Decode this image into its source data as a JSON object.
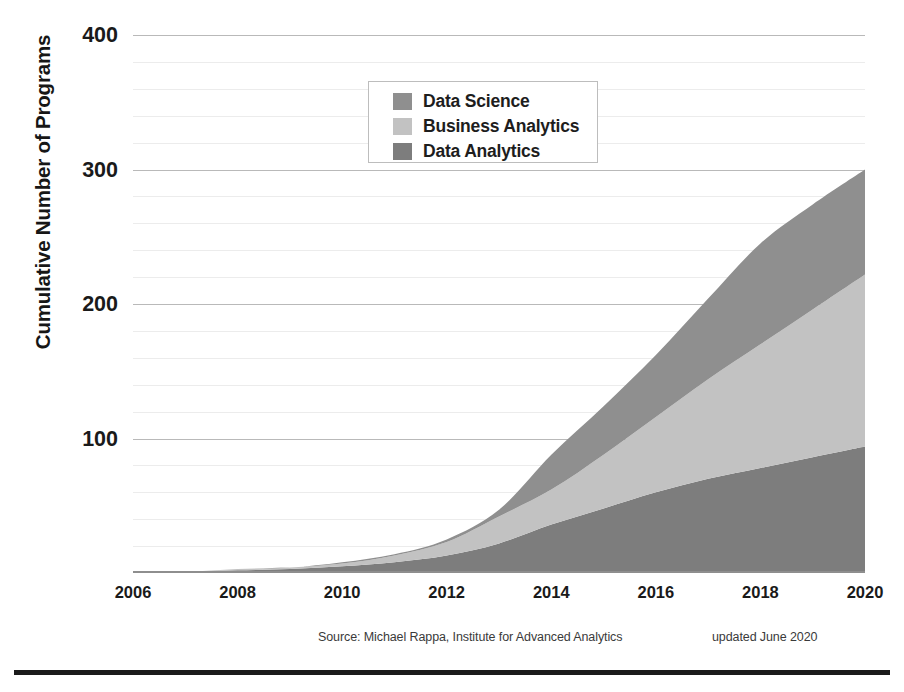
{
  "chart_data": {
    "type": "area",
    "stacked": true,
    "title": "",
    "xlabel": "",
    "ylabel": "Cumulative Number of Programs",
    "xlim": [
      2006,
      2020
    ],
    "ylim": [
      0,
      400
    ],
    "yticks": [
      100,
      200,
      300,
      400
    ],
    "ytick_labels": [
      "100",
      "200",
      "300",
      "400"
    ],
    "xticks": [
      2006,
      2008,
      2010,
      2012,
      2014,
      2016,
      2018,
      2020
    ],
    "xtick_labels": [
      "2006",
      "2008",
      "2010",
      "2012",
      "2014",
      "2016",
      "2018",
      "2020"
    ],
    "grid": true,
    "legend_position": "upper-center",
    "x": [
      2006,
      2007,
      2008,
      2009,
      2010,
      2011,
      2012,
      2013,
      2014,
      2015,
      2016,
      2017,
      2018,
      2019,
      2020
    ],
    "series": [
      {
        "name": "Data Analytics",
        "color": "#7d7d7d",
        "order": 1,
        "values": [
          1,
          1,
          2,
          3,
          5,
          8,
          13,
          22,
          36,
          48,
          60,
          70,
          78,
          86,
          94
        ]
      },
      {
        "name": "Business Analytics",
        "color": "#c2c2c2",
        "order": 2,
        "values": [
          0,
          0,
          1,
          1,
          2,
          5,
          10,
          20,
          26,
          40,
          56,
          74,
          92,
          110,
          128
        ]
      },
      {
        "name": "Data Science",
        "color": "#8f8f8f",
        "order": 3,
        "values": [
          0,
          0,
          0,
          0,
          1,
          1,
          2,
          5,
          26,
          36,
          46,
          60,
          75,
          78,
          78
        ]
      }
    ],
    "cumulative_totals": [
      1,
      1,
      3,
      4,
      8,
      14,
      25,
      47,
      88,
      124,
      162,
      204,
      245,
      274,
      300
    ],
    "legend": [
      {
        "label": "Data Science",
        "color": "#8f8f8f"
      },
      {
        "label": "Business Analytics",
        "color": "#c2c2c2"
      },
      {
        "label": "Data Analytics",
        "color": "#7d7d7d"
      }
    ]
  },
  "footer": {
    "source": "Source: Michael Rappa, Institute for Advanced Analytics",
    "updated": "updated June 2020"
  }
}
